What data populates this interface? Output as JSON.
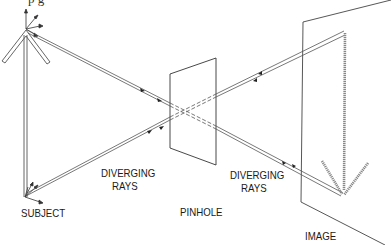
{
  "diagram": {
    "title_fragment": "p          g",
    "labels": {
      "subject": "SUBJECT",
      "diverging_left_1": "DIVERGING",
      "diverging_left_2": "RAYS",
      "pinhole": "PINHOLE",
      "diverging_right_1": "DIVERGING",
      "diverging_right_2": "RAYS",
      "image": "IMAGE"
    },
    "colors": {
      "line": "#555555",
      "ray": "#666666",
      "image_arrow": "#888888",
      "text": "#1a1a1a"
    }
  }
}
